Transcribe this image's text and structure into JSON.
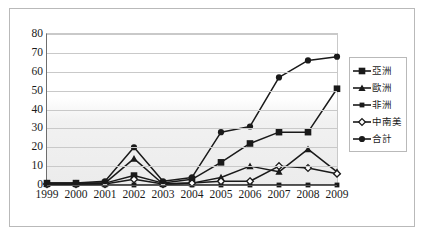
{
  "chart_data": {
    "type": "line",
    "title": "",
    "xlabel": "",
    "ylabel": "",
    "ylim": [
      0,
      80
    ],
    "ytick_step": 10,
    "grid": true,
    "legend_position": "right",
    "categories": [
      "1999",
      "2000",
      "2001",
      "2002",
      "2003",
      "2004",
      "2005",
      "2006",
      "2007",
      "2008",
      "2009"
    ],
    "yticks": [
      "0",
      "10",
      "20",
      "30",
      "40",
      "50",
      "60",
      "70",
      "80"
    ],
    "series": [
      {
        "name": "亞洲",
        "marker": "square",
        "color": "#1a1a1a",
        "values": [
          1,
          1,
          1,
          5,
          1,
          3,
          12,
          22,
          28,
          28,
          51
        ]
      },
      {
        "name": "歐洲",
        "marker": "triangle",
        "color": "#1a1a1a",
        "values": [
          0.5,
          0.5,
          1,
          14,
          0.5,
          1,
          4,
          10,
          7,
          19,
          7
        ]
      },
      {
        "name": "非洲",
        "marker": "square-small",
        "color": "#1a1a1a",
        "values": [
          0,
          0,
          0,
          0,
          0,
          0,
          0,
          0,
          0,
          0,
          0
        ]
      },
      {
        "name": "中南美",
        "marker": "diamond",
        "color": "#1a1a1a",
        "values": [
          0.5,
          0.5,
          0.5,
          3,
          0.5,
          1,
          2,
          2,
          10,
          9,
          6
        ]
      },
      {
        "name": "合計",
        "marker": "circle",
        "color": "#1a1a1a",
        "values": [
          1,
          1,
          2,
          20,
          2,
          4,
          28,
          31,
          57,
          66,
          68
        ]
      }
    ]
  },
  "legend": {
    "items": [
      {
        "label": "亞洲"
      },
      {
        "label": "歐洲"
      },
      {
        "label": "非洲"
      },
      {
        "label": "中南美"
      },
      {
        "label": "合計"
      }
    ]
  }
}
